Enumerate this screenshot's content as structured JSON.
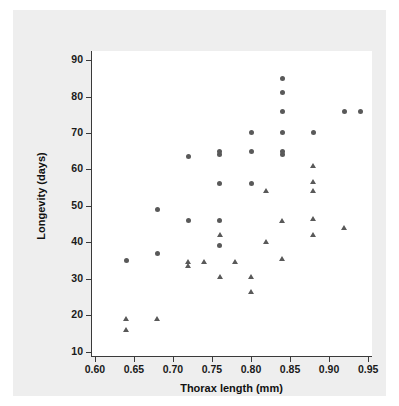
{
  "chart_data": {
    "type": "scatter",
    "title": "",
    "xlabel": "Thorax length (mm)",
    "ylabel": "Longevity (days)",
    "xlim": [
      0.595,
      0.955
    ],
    "ylim": [
      8.5,
      92.5
    ],
    "xticks": [
      0.6,
      0.65,
      0.7,
      0.75,
      0.8,
      0.85,
      0.9,
      0.95
    ],
    "xtick_labels": [
      "0.60",
      "0.65",
      "0.70",
      "0.75",
      "0.80",
      "0.85",
      "0.90",
      "0.95"
    ],
    "yticks": [
      10,
      20,
      30,
      40,
      50,
      60,
      70,
      80,
      90
    ],
    "ytick_labels": [
      "10",
      "20",
      "30",
      "40",
      "50",
      "60",
      "70",
      "80",
      "90"
    ],
    "grid": false,
    "legend": "none",
    "marker_color": "#595959",
    "series": [
      {
        "name": "circle-group",
        "marker": "circle",
        "color": "#595959",
        "points": [
          [
            0.64,
            35
          ],
          [
            0.68,
            37
          ],
          [
            0.68,
            49
          ],
          [
            0.72,
            46
          ],
          [
            0.72,
            63.5
          ],
          [
            0.76,
            46
          ],
          [
            0.76,
            39
          ],
          [
            0.76,
            56
          ],
          [
            0.76,
            64
          ],
          [
            0.76,
            65
          ],
          [
            0.8,
            56
          ],
          [
            0.8,
            65
          ],
          [
            0.8,
            70
          ],
          [
            0.84,
            64
          ],
          [
            0.84,
            65
          ],
          [
            0.84,
            70
          ],
          [
            0.84,
            76
          ],
          [
            0.84,
            81
          ],
          [
            0.84,
            85
          ],
          [
            0.88,
            70
          ],
          [
            0.92,
            76
          ],
          [
            0.94,
            76
          ]
        ]
      },
      {
        "name": "triangle-group",
        "marker": "triangle",
        "color": "#595959",
        "points": [
          [
            0.64,
            16
          ],
          [
            0.64,
            19
          ],
          [
            0.68,
            19
          ],
          [
            0.72,
            33.5
          ],
          [
            0.72,
            34.5
          ],
          [
            0.74,
            34.5
          ],
          [
            0.76,
            30.5
          ],
          [
            0.76,
            42
          ],
          [
            0.78,
            34.5
          ],
          [
            0.8,
            26.5
          ],
          [
            0.8,
            30.5
          ],
          [
            0.82,
            40
          ],
          [
            0.82,
            54
          ],
          [
            0.84,
            35.5
          ],
          [
            0.84,
            46
          ],
          [
            0.88,
            42
          ],
          [
            0.88,
            46.5
          ],
          [
            0.88,
            54
          ],
          [
            0.88,
            56.5
          ],
          [
            0.88,
            61
          ],
          [
            0.92,
            44
          ]
        ]
      }
    ]
  },
  "figure": {
    "panel_background": "#eeeeee",
    "plot_background": "#ffffff",
    "axis_color": "#3a3a3a",
    "text_color": "#111111"
  }
}
